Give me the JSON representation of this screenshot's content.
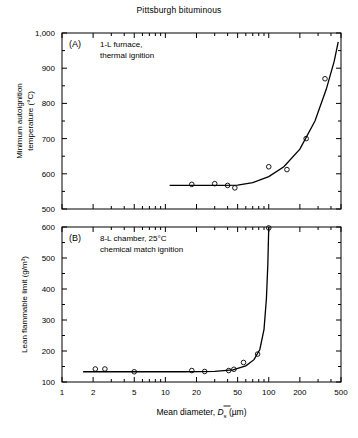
{
  "figure": {
    "title": "Pittsburgh bituminous",
    "xlabel_prefix": "Mean diameter, ",
    "xlabel_symbol": "D",
    "xlabel_sub": "s",
    "xlabel_units": " (µm)"
  },
  "chart_data": [
    {
      "type": "scatter",
      "panel": "(A)",
      "title": "Pittsburgh bituminous",
      "annotation_line1": "1-L furnace,",
      "annotation_line2": "thermal ignition",
      "xlabel": "Mean diameter, D̄s (µm)",
      "ylabel": "Minimum autoignition temperature (°C)",
      "ylabel_line1": "Minimum autoignition",
      "ylabel_line2": "temperature (°C)",
      "xscale": "log",
      "xlim": [
        1,
        500
      ],
      "ylim": [
        500,
        1000
      ],
      "xticks": [
        1,
        2,
        5,
        10,
        20,
        50,
        100,
        200,
        500
      ],
      "xticklabels": [
        "1",
        "2",
        "5",
        "10",
        "20",
        "50",
        "100",
        "200",
        "500"
      ],
      "yticks": [
        500,
        600,
        700,
        800,
        900,
        1000
      ],
      "yticklabels": [
        "500",
        "600",
        "700",
        "800",
        "900",
        "1,000"
      ],
      "yminorticks": [
        550,
        650,
        750,
        850,
        950
      ],
      "grid": false,
      "legend": false,
      "points": [
        {
          "x": 18,
          "y": 570
        },
        {
          "x": 30,
          "y": 572
        },
        {
          "x": 40,
          "y": 567
        },
        {
          "x": 47,
          "y": 560
        },
        {
          "x": 100,
          "y": 620
        },
        {
          "x": 150,
          "y": 612
        },
        {
          "x": 230,
          "y": 700
        },
        {
          "x": 350,
          "y": 870
        }
      ],
      "curve": [
        {
          "x": 11,
          "y": 567
        },
        {
          "x": 20,
          "y": 567
        },
        {
          "x": 35,
          "y": 567
        },
        {
          "x": 50,
          "y": 568
        },
        {
          "x": 70,
          "y": 575
        },
        {
          "x": 100,
          "y": 592
        },
        {
          "x": 140,
          "y": 620
        },
        {
          "x": 200,
          "y": 670
        },
        {
          "x": 280,
          "y": 750
        },
        {
          "x": 360,
          "y": 840
        },
        {
          "x": 430,
          "y": 920
        },
        {
          "x": 470,
          "y": 975
        }
      ]
    },
    {
      "type": "scatter",
      "panel": "(B)",
      "annotation_line1": "8-L chamber, 25°C",
      "annotation_line2": "chemical match ignition",
      "xlabel": "Mean diameter, D̄s (µm)",
      "ylabel": "Lean flammable limit (g/m³)",
      "xscale": "log",
      "xlim": [
        1,
        500
      ],
      "ylim": [
        100,
        600
      ],
      "xticks": [
        1,
        2,
        5,
        10,
        20,
        50,
        100,
        200,
        500
      ],
      "xticklabels": [
        "1",
        "2",
        "5",
        "10",
        "20",
        "50",
        "100",
        "200",
        "500"
      ],
      "yticks": [
        100,
        200,
        300,
        400,
        500,
        600
      ],
      "yticklabels": [
        "100",
        "200",
        "300",
        "400",
        "500",
        "600"
      ],
      "yminorticks": [
        150,
        250,
        350,
        450,
        550
      ],
      "grid": false,
      "legend": false,
      "points": [
        {
          "x": 2.1,
          "y": 142
        },
        {
          "x": 2.6,
          "y": 142
        },
        {
          "x": 5.0,
          "y": 133
        },
        {
          "x": 18,
          "y": 137
        },
        {
          "x": 24,
          "y": 134
        },
        {
          "x": 41,
          "y": 137
        },
        {
          "x": 46,
          "y": 141
        },
        {
          "x": 57,
          "y": 163
        },
        {
          "x": 78,
          "y": 190
        },
        {
          "x": 100,
          "y": 597
        }
      ],
      "curve": [
        {
          "x": 1.6,
          "y": 133
        },
        {
          "x": 5,
          "y": 133
        },
        {
          "x": 15,
          "y": 133
        },
        {
          "x": 30,
          "y": 134
        },
        {
          "x": 45,
          "y": 139
        },
        {
          "x": 60,
          "y": 152
        },
        {
          "x": 72,
          "y": 172
        },
        {
          "x": 82,
          "y": 205
        },
        {
          "x": 90,
          "y": 270
        },
        {
          "x": 95,
          "y": 370
        },
        {
          "x": 98,
          "y": 480
        },
        {
          "x": 100,
          "y": 600
        }
      ]
    }
  ]
}
